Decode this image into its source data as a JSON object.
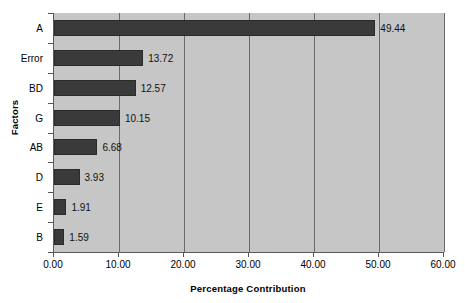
{
  "chart_data": {
    "type": "bar",
    "orientation": "horizontal",
    "title": "",
    "subtitle": "",
    "xlabel": "Percentage Contribution",
    "ylabel": "Factors",
    "categories": [
      "A",
      "Error",
      "BD",
      "G",
      "AB",
      "D",
      "E",
      "B"
    ],
    "values": [
      49.44,
      13.72,
      12.57,
      10.15,
      6.68,
      3.93,
      1.91,
      1.59
    ],
    "value_labels": [
      "49.44",
      "13.72",
      "12.57",
      "10.15",
      "6.68",
      "3.93",
      "1.91",
      "1.59"
    ],
    "xlim": [
      0,
      60
    ],
    "xticks": [
      0,
      10,
      20,
      30,
      40,
      50,
      60
    ],
    "xtick_labels": [
      "0.00",
      "10.00",
      "20.00",
      "30.00",
      "40.00",
      "50.00",
      "60.00"
    ],
    "grid": true,
    "grid_axis": "x",
    "legend": false,
    "legend_position": "none",
    "series": [
      {
        "name": "Percentage Contribution",
        "values": [
          49.44,
          13.72,
          12.57,
          10.15,
          6.68,
          3.93,
          1.91,
          1.59
        ]
      }
    ]
  },
  "style": {
    "bar_color": "#3a3a3a",
    "plot_background": "#c6c6c6",
    "page_background": "#ffffff",
    "axis_color": "#5a5a5a",
    "gridline_color": "#6a6a6a",
    "text_color": "#000000"
  }
}
